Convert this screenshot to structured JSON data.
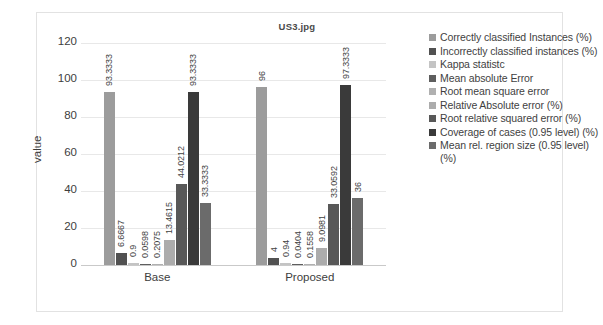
{
  "chart_data": {
    "type": "bar",
    "title": "US3.jpg",
    "xlabel": "",
    "ylabel": "value",
    "categories": [
      "Base",
      "Proposed"
    ],
    "ylim": [
      0,
      120
    ],
    "yticks": [
      0,
      20,
      40,
      60,
      80,
      100,
      120
    ],
    "grid": true,
    "legend_position": "right",
    "series": [
      {
        "name": "Correctly classified Instances (%)",
        "values": [
          93.3333,
          96
        ],
        "labels": [
          "93.3333",
          "96"
        ],
        "color": "#9c9c9c"
      },
      {
        "name": "Incorrectly classified instances (%)",
        "values": [
          6.6667,
          4
        ],
        "labels": [
          "6.6667",
          "4"
        ],
        "color": "#515151"
      },
      {
        "name": "Kappa statistc",
        "values": [
          0.9,
          0.94
        ],
        "labels": [
          "0.9",
          "0.94"
        ],
        "color": "#c4c4c4"
      },
      {
        "name": "Mean absolute Error",
        "values": [
          0.0598,
          0.0404
        ],
        "labels": [
          "0.0598",
          "0.0404"
        ],
        "color": "#5e5e5e"
      },
      {
        "name": "Root mean square error",
        "values": [
          0.2075,
          0.1558
        ],
        "labels": [
          "0.2075",
          "0.1558"
        ],
        "color": "#b0b0b0"
      },
      {
        "name": "Relative Absolute error (%)",
        "values": [
          13.4615,
          9.0981
        ],
        "labels": [
          "13.4615",
          "9.0981"
        ],
        "color": "#acacac"
      },
      {
        "name": "Root relative squared error (%)",
        "values": [
          44.0212,
          33.0592
        ],
        "labels": [
          "44.0212",
          "33.0592"
        ],
        "color": "#585858"
      },
      {
        "name": "Coverage of cases (0.95 level) (%)",
        "values": [
          93.3333,
          97.3333
        ],
        "labels": [
          "93.3333",
          "97.3333"
        ],
        "color": "#3a3a3a"
      },
      {
        "name": "Mean rel. region size (0.95 level) (%)",
        "values": [
          33.3333,
          36
        ],
        "labels": [
          "33.3333",
          "36"
        ],
        "color": "#6b6b6b"
      }
    ]
  },
  "axis": {
    "y_label": "value",
    "y_ticks": [
      "120",
      "100",
      "80",
      "60",
      "40",
      "20",
      "0"
    ],
    "x_categories": [
      "Base",
      "Proposed"
    ]
  },
  "legend": {
    "items": [
      {
        "label": "Correctly classified Instances (%)",
        "color": "#9c9c9c"
      },
      {
        "label": "Incorrectly classified instances (%)",
        "color": "#515151"
      },
      {
        "label": "Kappa statistc",
        "color": "#c4c4c4"
      },
      {
        "label": "Mean absolute Error",
        "color": "#5e5e5e"
      },
      {
        "label": "Root mean square error",
        "color": "#b0b0b0"
      },
      {
        "label": "Relative Absolute error (%)",
        "color": "#acacac"
      },
      {
        "label": "Root relative squared error (%)",
        "color": "#585858"
      },
      {
        "label": "Coverage of cases (0.95 level) (%)",
        "color": "#3a3a3a"
      },
      {
        "label": "Mean rel. region size (0.95 level) (%)",
        "color": "#6b6b6b"
      }
    ]
  }
}
